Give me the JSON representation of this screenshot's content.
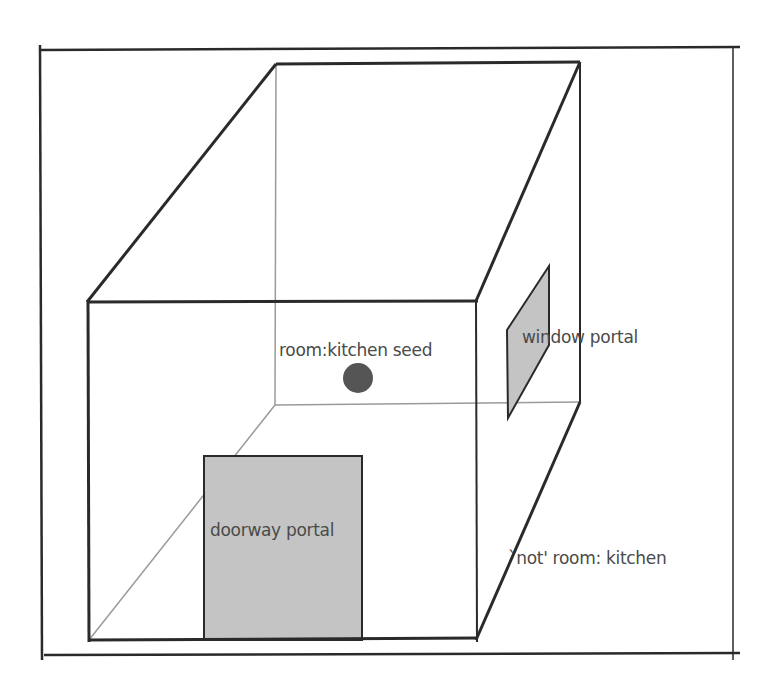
{
  "diagram": {
    "type": "3d-room-box",
    "labels": {
      "seed": "room:kitchen seed",
      "window": "window portal",
      "doorway": "doorway portal",
      "outside": "`not' room: kitchen"
    },
    "colors": {
      "line": "#2a2a2a",
      "hidden_line": "#9a9a9a",
      "portal_fill": "#c4c4c4",
      "seed_dot": "#555555",
      "text": "#4a4a4a"
    }
  }
}
